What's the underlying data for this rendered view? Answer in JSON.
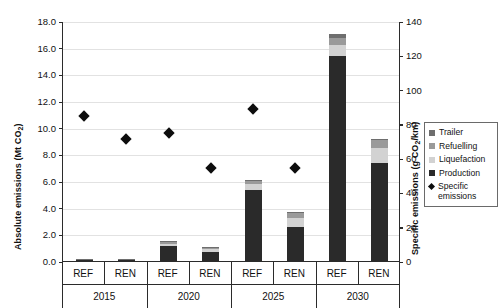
{
  "chart_data": {
    "type": "bar",
    "title": "",
    "subtitle": "",
    "ylabel": "Absolute emissions (Mt CO2)",
    "ylabel_parts": {
      "main": "Absolute emissions (Mt CO",
      "sub": "2",
      "tail": ")"
    },
    "y2label": "Specific emissions (g CO2/km)",
    "y2label_parts": {
      "main": "Specific emissions (g CO",
      "sub": "2",
      "tail": "/km)"
    },
    "xlabel": "",
    "ylim": [
      0,
      18
    ],
    "y2lim": [
      0,
      140
    ],
    "yticks": [
      "0.0",
      "2.0",
      "4.0",
      "6.0",
      "8.0",
      "10.0",
      "12.0",
      "14.0",
      "16.0",
      "18.0"
    ],
    "ytick_values": [
      0,
      2,
      4,
      6,
      8,
      10,
      12,
      14,
      16,
      18
    ],
    "y2ticks": [
      "0",
      "20",
      "40",
      "60",
      "80",
      "100",
      "120",
      "140"
    ],
    "y2tick_values": [
      0,
      20,
      40,
      60,
      80,
      100,
      120,
      140
    ],
    "grid": true,
    "legend_position": "right",
    "groups": [
      "2015",
      "2020",
      "2025",
      "2030"
    ],
    "scenarios": [
      "REF",
      "REN"
    ],
    "categories": [
      "2015 REF",
      "2015 REN",
      "2020 REF",
      "2020 REN",
      "2025 REF",
      "2025 REN",
      "2030 REF",
      "2030 REN"
    ],
    "series": [
      {
        "name": "Production",
        "color": "#2a2a2a",
        "values": [
          0.08,
          0.06,
          1.15,
          0.7,
          5.3,
          2.55,
          15.35,
          7.35
        ]
      },
      {
        "name": "Liquefaction",
        "color": "#d2d2d2",
        "values": [
          0.02,
          0.02,
          0.15,
          0.18,
          0.45,
          0.65,
          0.85,
          1.15
        ]
      },
      {
        "name": "Refuelling",
        "color": "#9a9a9a",
        "values": [
          0.01,
          0.01,
          0.12,
          0.12,
          0.3,
          0.4,
          0.55,
          0.6
        ]
      },
      {
        "name": "Trailer",
        "color": "#6e6e6e",
        "values": [
          0.01,
          0.01,
          0.08,
          0.05,
          0.05,
          0.05,
          0.3,
          0.05
        ]
      }
    ],
    "marker_series": {
      "name": "Specific emissions",
      "color": "#0d0d0d",
      "marker": "diamond",
      "axis": "right",
      "values": [
        85,
        72,
        75,
        55,
        89,
        55,
        null,
        null
      ]
    }
  },
  "legend": {
    "items": [
      {
        "label": "Trailer",
        "color": "#6e6e6e",
        "marker": "square"
      },
      {
        "label": "Refuelling",
        "color": "#9a9a9a",
        "marker": "square"
      },
      {
        "label": "Liquefaction",
        "color": "#d2d2d2",
        "marker": "square"
      },
      {
        "label": "Production",
        "color": "#2a2a2a",
        "marker": "square"
      },
      {
        "label": "Specific emissions",
        "color": "#0d0d0d",
        "marker": "diamond"
      }
    ]
  },
  "axis": {
    "left_title_main": "Absolute emissions (Mt CO",
    "left_title_sub": "2",
    "left_title_tail": ")",
    "right_title_main": "Specific emissions (g CO",
    "right_title_sub": "2",
    "right_title_tail": "/km)"
  }
}
